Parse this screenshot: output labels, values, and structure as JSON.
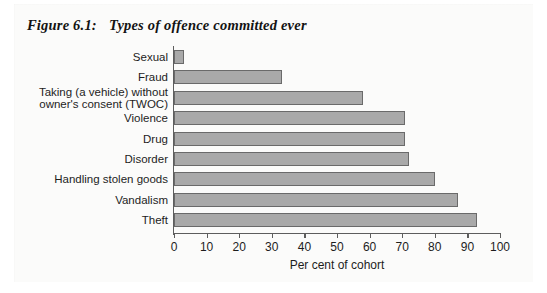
{
  "figure": {
    "number": "Figure 6.1:",
    "title": "Types of offence committed ever"
  },
  "chart_data": {
    "type": "bar",
    "orientation": "horizontal",
    "title": "Types of offence committed ever",
    "xlabel": "Per cent of cohort",
    "ylabel": "",
    "xlim": [
      0,
      100
    ],
    "xticks": [
      0,
      10,
      20,
      30,
      40,
      50,
      60,
      70,
      80,
      90,
      100
    ],
    "grid": false,
    "legend": null,
    "bar_color": "#a9a9a9",
    "bar_edge_color": "#6a6a6a",
    "categories": [
      "Sexual",
      "Fraud",
      "Taking (a vehicle) without\nowner's consent (TWOC)",
      "Violence",
      "Drug",
      "Disorder",
      "Handling stolen goods",
      "Vandalism",
      "Theft"
    ],
    "values": [
      3,
      33,
      58,
      71,
      71,
      72,
      80,
      87,
      93
    ]
  }
}
